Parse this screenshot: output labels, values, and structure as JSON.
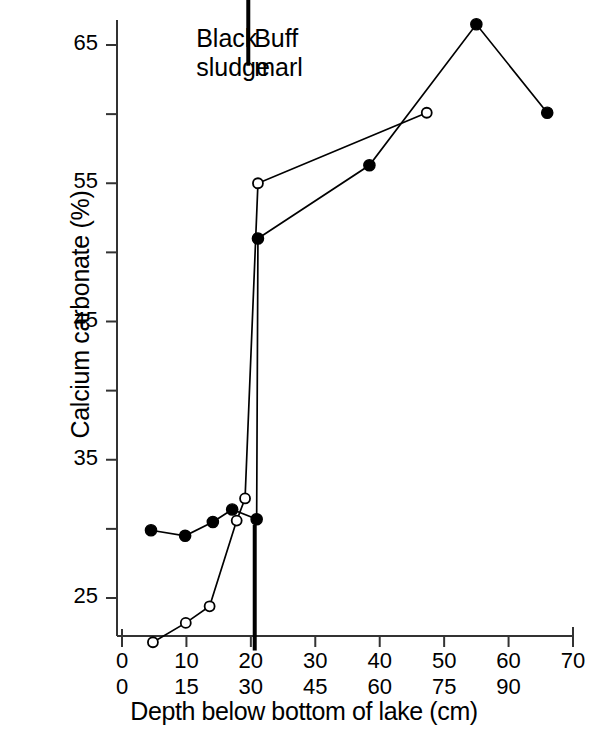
{
  "chart_data": {
    "type": "line",
    "title": "",
    "xlabel": "Depth below bottom of lake  (cm)",
    "ylabel": "Calcium carbonate (%)",
    "xlim": [
      0,
      70
    ],
    "ylim": [
      21,
      68
    ],
    "grid": false,
    "legend": "none",
    "x_axis_primary_ticks": [
      "0",
      "10",
      "20",
      "30",
      "40",
      "50",
      "60",
      "70"
    ],
    "x_axis_primary_values": [
      0,
      10,
      20,
      30,
      40,
      50,
      60,
      70
    ],
    "x_axis_secondary_ticks": [
      "0",
      "15",
      "30",
      "45",
      "60",
      "75",
      "90"
    ],
    "x_axis_secondary_values": [
      0,
      15,
      30,
      45,
      60,
      75,
      90
    ],
    "y_major_ticks": [
      "25",
      "35",
      "45",
      "55",
      "65"
    ],
    "y_major_values": [
      25,
      35,
      45,
      55,
      65
    ],
    "y_minor_values": [
      30,
      40,
      50,
      60
    ],
    "annotations": [
      {
        "name": "black-sludge",
        "text": "Black\nsludge",
        "x": 14,
        "y": 65
      },
      {
        "name": "buff-marl",
        "text": "Buff\nmarl",
        "x": 23,
        "y": 65
      },
      {
        "name": "zone-divider-upper",
        "type": "vline",
        "x": 19.6,
        "y_from": 63.5,
        "y_to": 70.2
      },
      {
        "name": "zone-divider-lower",
        "type": "vline",
        "x": 20.6,
        "y_from": 21.2,
        "y_to": 30.3
      }
    ],
    "series": [
      {
        "name": "open-circle-series",
        "marker": "open-circle",
        "color": "#000000",
        "points": [
          {
            "x": 4.8,
            "y": 21.8
          },
          {
            "x": 9.9,
            "y": 23.2
          },
          {
            "x": 13.6,
            "y": 24.4
          },
          {
            "x": 17.8,
            "y": 30.6
          },
          {
            "x": 19.1,
            "y": 32.2
          },
          {
            "x": 21.1,
            "y": 55.0
          },
          {
            "x": 47.3,
            "y": 60.1
          }
        ]
      },
      {
        "name": "filled-circle-series",
        "marker": "filled-circle",
        "color": "#000000",
        "points": [
          {
            "x": 4.5,
            "y": 29.9
          },
          {
            "x": 9.8,
            "y": 29.5
          },
          {
            "x": 14.1,
            "y": 30.5
          },
          {
            "x": 17.1,
            "y": 31.4
          },
          {
            "x": 20.9,
            "y": 30.7
          },
          {
            "x": 21.1,
            "y": 51.0
          },
          {
            "x": 38.4,
            "y": 56.3
          },
          {
            "x": 55.0,
            "y": 66.5
          },
          {
            "x": 66.0,
            "y": 60.1
          }
        ]
      }
    ]
  },
  "axes": {
    "y_axis_name": "y-axis",
    "x_axis_name": "x-axis"
  }
}
